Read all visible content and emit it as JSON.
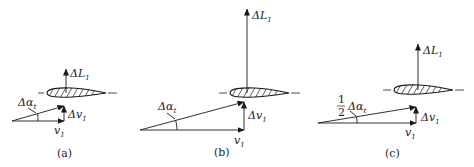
{
  "figure": {
    "panels": [
      {
        "id": "a",
        "caption": "(a)",
        "lift_label": "ΔL",
        "lift_sub": "1",
        "angle_label": "Δα",
        "angle_sub": "t",
        "angle_prefix": "",
        "dv_label": "Δv",
        "dv_sub": "1",
        "v_label": "v",
        "v_sub": "1"
      },
      {
        "id": "b",
        "caption": "(b)",
        "lift_label": "ΔL",
        "lift_sub": "1",
        "angle_label": "Δα",
        "angle_sub": "t",
        "angle_prefix": "",
        "dv_label": "Δv",
        "dv_sub": "1",
        "v_label": "v",
        "v_sub": "1"
      },
      {
        "id": "c",
        "caption": "(c)",
        "lift_label": "ΔL",
        "lift_sub": "1",
        "angle_label": "Δα",
        "angle_sub": "t",
        "angle_prefix_num": "1",
        "angle_prefix_den": "2",
        "dv_label": "Δv",
        "dv_sub": "1",
        "v_label": "v",
        "v_sub": "1"
      }
    ]
  }
}
